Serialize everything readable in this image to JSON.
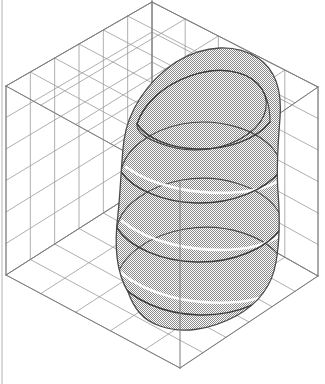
{
  "figure": {
    "title": "3D Surface Plot",
    "type": "surface-3d",
    "projection": "axonometric",
    "background_color": "#ffffff",
    "width": 325,
    "height": 384
  },
  "style": {
    "box_line_color": "#7c7c7c",
    "grid_line_color": "#9a9a9a",
    "surface_fill_color": "#b9b9b9",
    "surface_dither_dark": "#808080",
    "surface_dither_light": "#ffffff",
    "surface_outline_color": "#4a4a4a",
    "contour_line_color": "#3c3c3c",
    "highlight_line_color": "#ffffff",
    "box_line_width": 1,
    "grid_line_width": 0.8,
    "contour_line_width": 1.1
  },
  "bounding_box": {
    "label": "axis-box",
    "corners": {
      "top_back": [
        152,
        2
      ],
      "top_left": [
        6,
        86
      ],
      "top_right": [
        318,
        87
      ],
      "top_front": [
        180,
        182
      ],
      "bottom_back": [
        152,
        182
      ],
      "bottom_left": [
        6,
        275
      ],
      "bottom_right": [
        318,
        276
      ],
      "bottom_front": [
        180,
        368
      ]
    },
    "grid_divisions_u": 6,
    "grid_divisions_v": 5,
    "grid_divisions_w": 6
  },
  "chart_data": {
    "type": "surface",
    "title": "3D Surface Plot",
    "xlabel": "",
    "ylabel": "",
    "zlabel": "",
    "grid": true,
    "legend": "none",
    "xlim": [
      -1,
      1
    ],
    "ylim": [
      -1,
      1
    ],
    "zlim": [
      0,
      1
    ],
    "contour_levels": [
      0.12,
      0.3,
      0.48,
      0.66,
      0.84,
      0.97
    ],
    "contour_count": 6,
    "surface_profile": {
      "base_half_width": 1.0,
      "top_half_width": 0.52,
      "peak_height": 1.0,
      "shape": "rounded-bell"
    }
  },
  "surface": {
    "name": "surface-mesh",
    "silhouette_path": "M 128 292 C 116 272 114 245 118 214 C 121 186 121 163 124 140 C 128 112 146 82 176 62 C 206 44 236 44 258 58 C 276 70 282 92 280 118 C 278 144 276 166 278 192 C 280 218 280 240 276 262 C 272 286 258 304 236 316 C 210 330 182 334 160 326 C 142 320 134 308 128 292 Z",
    "top_cap_path": "M 124 140 C 128 112 146 82 176 62 C 206 44 236 44 258 58 C 276 70 282 92 280 118 C 262 142 230 158 196 159 C 162 160 136 152 124 140 Z",
    "top_inner_contour_path": "M 137 124 C 144 103 164 85 190 76 C 218 66 244 70 258 84 C 272 99 268 120 248 134 C 226 150 194 154 168 146 C 148 140 136 133 137 124 Z",
    "contour_rings": [
      {
        "level": 0.97,
        "front_path": "M 137 124 C 146 138 170 148 196 149 C 226 150 256 140 270 122",
        "back_path": "M 137 124 C 144 103 164 85 190 76 C 218 66 244 70 258 84 C 268 95 270 109 270 122"
      },
      {
        "level": 0.84,
        "front_path": "M 121 172 C 134 190 164 202 196 203 C 232 204 266 190 281 170",
        "back_path": "M 121 172 C 124 150 150 130 182 124 C 220 117 258 130 274 150 C 279 157 281 164 281 170"
      },
      {
        "level": 0.66,
        "front_path": "M 117 228 C 130 248 162 261 196 262 C 234 263 268 248 282 227",
        "back_path": "M 117 228 C 120 206 148 186 182 180 C 221 173 260 187 276 208 C 281 214 282 221 282 227"
      },
      {
        "level": 0.48,
        "front_path": "M 117 279 C 131 300 164 314 199 315 C 238 316 272 300 285 278",
        "back_path": "M 117 279 C 120 256 149 235 185 229 C 225 222 265 236 281 258 C 285 265 285 272 285 279"
      },
      {
        "level": 0.3,
        "front_path": "M 124 316 C 140 338 174 351 209 351 C 247 351 278 336 290 315"
      }
    ],
    "highlight_lines": [
      "M 126 167 C 152 186 196 196 240 192 C 264 190 280 182 288 172",
      "M 122 221 C 148 242 192 253 238 249 C 262 247 280 238 289 227",
      "M 120 272 C 146 294 190 306 238 302 C 262 300 281 290 291 279",
      "M 126 314 C 152 337 196 349 244 345 C 268 343 288 332 298 320"
    ]
  },
  "annotations": []
}
